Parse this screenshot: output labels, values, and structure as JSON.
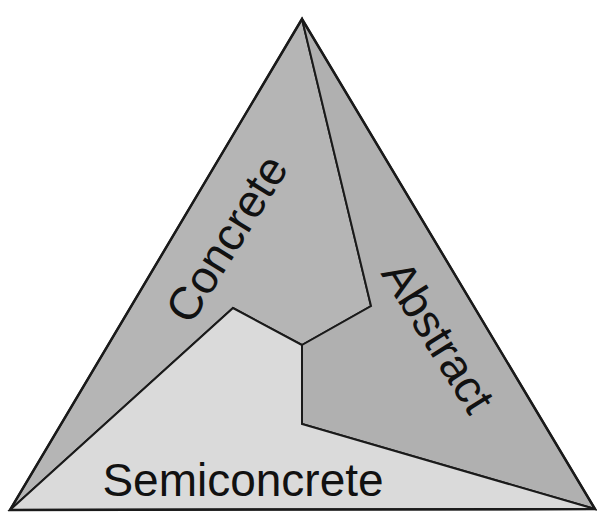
{
  "diagram": {
    "type": "triangle-partition",
    "regions": [
      {
        "id": "concrete",
        "label": "Concrete",
        "fill": "#b5b5b5",
        "position": "upper-left"
      },
      {
        "id": "abstract",
        "label": "Abstract",
        "fill": "#b0b0b0",
        "position": "right"
      },
      {
        "id": "semiconcrete",
        "label": "Semiconcrete",
        "fill": "#dadada",
        "position": "bottom"
      }
    ],
    "outline_color": "#1a1a1a",
    "background": "#ffffff"
  }
}
